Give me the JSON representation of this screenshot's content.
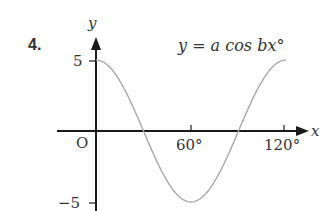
{
  "question_number": "4.",
  "equation_label": "y = a cos bx°",
  "axes": {
    "x_label": "x",
    "y_label": "y",
    "origin_label": "O",
    "y_tick_labels": [
      "5",
      "−5"
    ],
    "x_tick_labels": [
      "60°",
      "120°"
    ]
  },
  "colors": {
    "axis": "#1a1a1a",
    "curve": "#a8a8a8",
    "text": "#333333"
  },
  "chart_data": {
    "type": "line",
    "title": "y = a cos bx°",
    "xlabel": "x",
    "ylabel": "y",
    "x": [
      0,
      15,
      30,
      45,
      60,
      75,
      90,
      105,
      120
    ],
    "series": [
      {
        "name": "y = 5 cos 3x°",
        "values": [
          5,
          3.54,
          0,
          -3.54,
          -5,
          -3.54,
          0,
          3.54,
          5
        ]
      }
    ],
    "xlim": [
      0,
      120
    ],
    "ylim": [
      -5,
      5
    ],
    "x_ticks": [
      60,
      120
    ],
    "y_ticks": [
      5,
      -5
    ],
    "grid": false,
    "legend": "none",
    "annotations": [
      "y = a cos bx°",
      "O"
    ]
  }
}
